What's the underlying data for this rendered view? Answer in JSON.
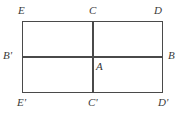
{
  "figure": {
    "kind": "geometry-diagram",
    "background_color": "#ffffff",
    "stroke_color": "#4a4a4a",
    "label_color": "#3a3a3a",
    "rectangle": {
      "left": 22,
      "top": 21,
      "right": 163,
      "bottom": 93,
      "width": 141,
      "height": 72
    },
    "midlines": {
      "horizontal_y": 57,
      "vertical_x": 93
    },
    "labels": [
      {
        "id": "E",
        "text": "E",
        "point": "top-left-corner"
      },
      {
        "id": "C",
        "text": "C",
        "point": "top-midpoint"
      },
      {
        "id": "D",
        "text": "D",
        "point": "top-right-corner"
      },
      {
        "id": "Bp",
        "text": "B'",
        "point": "left-midpoint"
      },
      {
        "id": "A",
        "text": "A",
        "point": "center"
      },
      {
        "id": "B",
        "text": "B",
        "point": "right-midpoint"
      },
      {
        "id": "Ep",
        "text": "E'",
        "point": "bottom-left-corner"
      },
      {
        "id": "Cp",
        "text": "C'",
        "point": "bottom-midpoint"
      },
      {
        "id": "Dp",
        "text": "D'",
        "point": "bottom-right-corner"
      }
    ]
  }
}
